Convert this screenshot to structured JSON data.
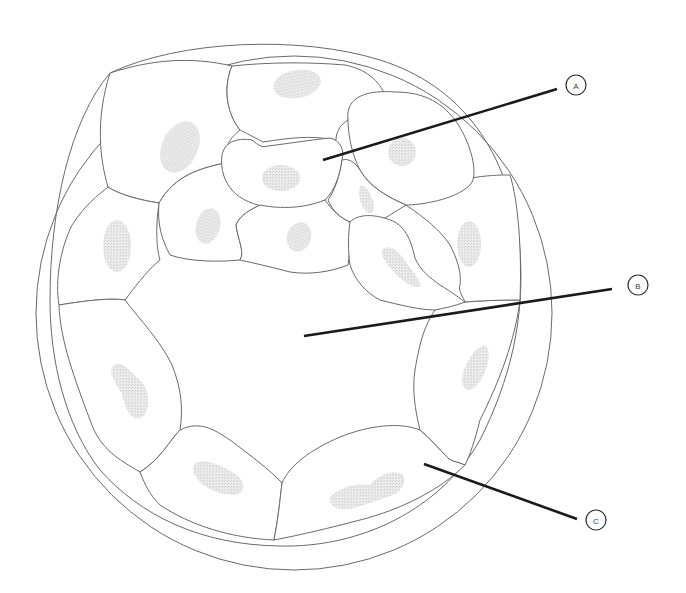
{
  "diagram": {
    "colors": {
      "outline": "#6a6a6a",
      "nucleus_fill": "#e6e6e6",
      "leader_line": "#1a1a1a",
      "background": "#ffffff"
    },
    "labels": [
      {
        "id": "A",
        "text": "A",
        "points_to": "inner cell mass"
      },
      {
        "id": "B",
        "text": "B",
        "points_to": "blastocoel cavity"
      },
      {
        "id": "C",
        "text": "C",
        "points_to": "trophoblast cell"
      }
    ]
  }
}
